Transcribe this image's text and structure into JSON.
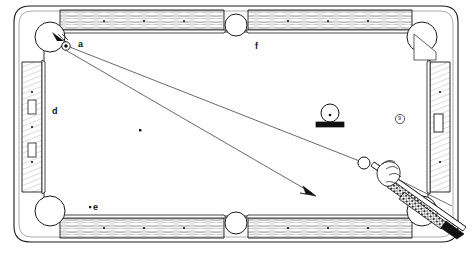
{
  "scene": {
    "title": "Pool table diagram - bank shot aiming",
    "width": 472,
    "height": 254
  },
  "labels": [
    {
      "id": "a",
      "text": "a",
      "x": 78,
      "y": 40
    },
    {
      "id": "f",
      "text": "f",
      "x": 255,
      "y": 42
    },
    {
      "id": "d",
      "text": "d",
      "x": 52,
      "y": 107
    },
    {
      "id": "e",
      "text": "e",
      "x": 93,
      "y": 203
    }
  ],
  "balls": [
    {
      "name": "object-ball-on-rack",
      "x": 330,
      "y": 114,
      "r": 9,
      "number": ""
    },
    {
      "name": "cue-ball",
      "x": 364,
      "y": 163,
      "r": 6,
      "number": ""
    },
    {
      "name": "pocket-marker-corner",
      "x": 66,
      "y": 46,
      "r": 4,
      "number": ""
    },
    {
      "name": "nine-ball-marker",
      "x": 400,
      "y": 119,
      "r": 4.5,
      "number": "9"
    }
  ],
  "table": {
    "felt_color": "#ffffff",
    "rail_color": "#f2f2f0",
    "line_color": "#1a1a1a",
    "rack_color": "#111111",
    "outer": {
      "x": 14,
      "y": 6,
      "w": 444,
      "h": 236
    },
    "cushion_inset": 28,
    "rail_diamonds_top_left": 3,
    "rail_diamonds_top_right": 3,
    "rail_diamonds_bottom_left": 3,
    "rail_diamonds_bottom_right": 3,
    "rail_diamonds_left": 3,
    "rail_diamonds_right": 3,
    "left_rail_sights": 2,
    "right_rail_sight": 1
  },
  "spots": [
    {
      "name": "felt-spot-center-left",
      "x": 140,
      "y": 130
    },
    {
      "name": "felt-spot-lower-left",
      "x": 90,
      "y": 207
    }
  ],
  "aim_lines": [
    {
      "name": "aim-line-pocket-to-cueball",
      "x1": 62,
      "y1": 44,
      "x2": 362,
      "y2": 162
    },
    {
      "name": "aim-line-pocket-to-arrow",
      "x1": 62,
      "y1": 48,
      "x2": 315,
      "y2": 195
    }
  ],
  "arrow": {
    "name": "aim-arrowhead",
    "x": 315,
    "y": 195,
    "angle": 30
  },
  "cue": {
    "name": "cue-stick",
    "tip_x": 372,
    "tip_y": 166,
    "butt_x": 462,
    "butt_y": 232
  }
}
